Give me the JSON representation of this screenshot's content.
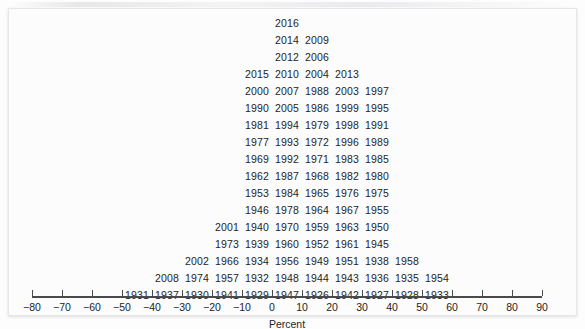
{
  "figure": {
    "background_color": "#fcfcfc",
    "text_color": "#242424",
    "axis_color": "#4a4a4a"
  },
  "axis": {
    "title": "Percent",
    "tick_labels": [
      "−80",
      "−70",
      "−60",
      "−50",
      "−40",
      "−30",
      "−20",
      "−10",
      "0",
      "10",
      "20",
      "30",
      "40",
      "50",
      "60",
      "70",
      "80",
      "90"
    ],
    "tick_values": [
      -80,
      -70,
      -60,
      -50,
      -40,
      -30,
      -20,
      -10,
      0,
      10,
      20,
      30,
      40,
      50,
      60,
      70,
      80,
      90
    ]
  },
  "chart_data": {
    "type": "bar",
    "subtype": "stacked-label-dotplot",
    "title": "",
    "subtitle": "",
    "xlabel": "Percent",
    "ylabel": "",
    "xlim": [
      -80,
      90
    ],
    "bin_width": 10,
    "grid": false,
    "legend": "none",
    "annotation": "Each label is one observation (a year) placed in its percent bin; labels stack upward within the bin.",
    "bins": [
      {
        "bin_center": -45,
        "bin_range": [
          -50,
          -40
        ],
        "count": 1,
        "labels": [
          "1931"
        ]
      },
      {
        "bin_center": -35,
        "bin_range": [
          -40,
          -30
        ],
        "count": 2,
        "labels": [
          "1937",
          "2008"
        ]
      },
      {
        "bin_center": -25,
        "bin_range": [
          -30,
          -20
        ],
        "count": 3,
        "labels": [
          "1930",
          "1974",
          "2002"
        ]
      },
      {
        "bin_center": -15,
        "bin_range": [
          -20,
          -10
        ],
        "count": 5,
        "labels": [
          "1941",
          "1957",
          "1966",
          "1973",
          "2001"
        ]
      },
      {
        "bin_center": -5,
        "bin_range": [
          -10,
          0
        ],
        "count": 14,
        "labels": [
          "1929",
          "1932",
          "1934",
          "1939",
          "1940",
          "1946",
          "1953",
          "1962",
          "1969",
          "1977",
          "1981",
          "1990",
          "2000",
          "2015"
        ]
      },
      {
        "bin_center": 5,
        "bin_range": [
          0,
          10
        ],
        "count": 18,
        "labels": [
          "1947",
          "1948",
          "1956",
          "1960",
          "1970",
          "1978",
          "1984",
          "1992",
          "1993",
          "1994",
          "2005",
          "2007",
          "2010",
          "2012",
          "2014",
          "2016"
        ]
      },
      {
        "bin_center": 15,
        "bin_range": [
          10,
          20
        ],
        "count": 16,
        "labels": [
          "1926",
          "1944",
          "1949",
          "1952",
          "1959",
          "1964",
          "1965",
          "1968",
          "1971",
          "1972",
          "1979",
          "1986",
          "1988",
          "2004",
          "2006",
          "2009"
        ]
      },
      {
        "bin_center": 25,
        "bin_range": [
          20,
          30
        ],
        "count": 14,
        "labels": [
          "1942",
          "1943",
          "1951",
          "1961",
          "1963",
          "1967",
          "1976",
          "1982",
          "1983",
          "1996",
          "1998",
          "1999",
          "2003"
        ]
      },
      {
        "bin_center": 35,
        "bin_range": [
          30,
          40
        ],
        "count": 12,
        "labels": [
          "1927",
          "1936",
          "1938",
          "1945",
          "1950",
          "1955",
          "1975",
          "1980",
          "1985",
          "1989",
          "1991",
          "1995",
          "1997",
          "2013"
        ]
      },
      {
        "bin_center": 45,
        "bin_range": [
          40,
          50
        ],
        "count": 3,
        "labels": [
          "1928",
          "1935",
          "1958"
        ]
      },
      {
        "bin_center": 55,
        "bin_range": [
          50,
          60
        ],
        "count": 2,
        "labels": [
          "1933",
          "1954"
        ]
      }
    ],
    "rows": [
      {
        "y": 17,
        "cells": [
          {
            "bin": 5,
            "label": "2016"
          }
        ]
      },
      {
        "y": 34,
        "cells": [
          {
            "bin": 5,
            "label": "2014"
          },
          {
            "bin": 15,
            "label": "2009"
          }
        ]
      },
      {
        "y": 51,
        "cells": [
          {
            "bin": 5,
            "label": "2012"
          },
          {
            "bin": 15,
            "label": "2006"
          }
        ]
      },
      {
        "y": 68,
        "cells": [
          {
            "bin": -5,
            "label": "2015"
          },
          {
            "bin": 5,
            "label": "2010"
          },
          {
            "bin": 15,
            "label": "2004"
          },
          {
            "bin": 25,
            "label": "2013"
          }
        ]
      },
      {
        "y": 85,
        "cells": [
          {
            "bin": -5,
            "label": "2000"
          },
          {
            "bin": 5,
            "label": "2007"
          },
          {
            "bin": 15,
            "label": "1988"
          },
          {
            "bin": 25,
            "label": "2003"
          },
          {
            "bin": 35,
            "label": "1997"
          }
        ]
      },
      {
        "y": 102,
        "cells": [
          {
            "bin": -5,
            "label": "1990"
          },
          {
            "bin": 5,
            "label": "2005"
          },
          {
            "bin": 15,
            "label": "1986"
          },
          {
            "bin": 25,
            "label": "1999"
          },
          {
            "bin": 35,
            "label": "1995"
          }
        ]
      },
      {
        "y": 119,
        "cells": [
          {
            "bin": -5,
            "label": "1981"
          },
          {
            "bin": 5,
            "label": "1994"
          },
          {
            "bin": 15,
            "label": "1979"
          },
          {
            "bin": 25,
            "label": "1998"
          },
          {
            "bin": 35,
            "label": "1991"
          }
        ]
      },
      {
        "y": 136,
        "cells": [
          {
            "bin": -5,
            "label": "1977"
          },
          {
            "bin": 5,
            "label": "1993"
          },
          {
            "bin": 15,
            "label": "1972"
          },
          {
            "bin": 25,
            "label": "1996"
          },
          {
            "bin": 35,
            "label": "1989"
          }
        ]
      },
      {
        "y": 153,
        "cells": [
          {
            "bin": -5,
            "label": "1969"
          },
          {
            "bin": 5,
            "label": "1992"
          },
          {
            "bin": 15,
            "label": "1971"
          },
          {
            "bin": 25,
            "label": "1983"
          },
          {
            "bin": 35,
            "label": "1985"
          }
        ]
      },
      {
        "y": 170,
        "cells": [
          {
            "bin": -5,
            "label": "1962"
          },
          {
            "bin": 5,
            "label": "1987"
          },
          {
            "bin": 15,
            "label": "1968"
          },
          {
            "bin": 25,
            "label": "1982"
          },
          {
            "bin": 35,
            "label": "1980"
          }
        ]
      },
      {
        "y": 187,
        "cells": [
          {
            "bin": -5,
            "label": "1953"
          },
          {
            "bin": 5,
            "label": "1984"
          },
          {
            "bin": 15,
            "label": "1965"
          },
          {
            "bin": 25,
            "label": "1976"
          },
          {
            "bin": 35,
            "label": "1975"
          }
        ]
      },
      {
        "y": 204,
        "cells": [
          {
            "bin": -5,
            "label": "1946"
          },
          {
            "bin": 5,
            "label": "1978"
          },
          {
            "bin": 15,
            "label": "1964"
          },
          {
            "bin": 25,
            "label": "1967"
          },
          {
            "bin": 35,
            "label": "1955"
          }
        ]
      },
      {
        "y": 221,
        "cells": [
          {
            "bin": -15,
            "label": "2001"
          },
          {
            "bin": -5,
            "label": "1940"
          },
          {
            "bin": 5,
            "label": "1970"
          },
          {
            "bin": 15,
            "label": "1959"
          },
          {
            "bin": 25,
            "label": "1963"
          },
          {
            "bin": 35,
            "label": "1950"
          }
        ]
      },
      {
        "y": 238,
        "cells": [
          {
            "bin": -15,
            "label": "1973"
          },
          {
            "bin": -5,
            "label": "1939"
          },
          {
            "bin": 5,
            "label": "1960"
          },
          {
            "bin": 15,
            "label": "1952"
          },
          {
            "bin": 25,
            "label": "1961"
          },
          {
            "bin": 35,
            "label": "1945"
          }
        ]
      },
      {
        "y": 255,
        "cells": [
          {
            "bin": -25,
            "label": "2002"
          },
          {
            "bin": -15,
            "label": "1966"
          },
          {
            "bin": -5,
            "label": "1934"
          },
          {
            "bin": 5,
            "label": "1956"
          },
          {
            "bin": 15,
            "label": "1949"
          },
          {
            "bin": 25,
            "label": "1951"
          },
          {
            "bin": 35,
            "label": "1938"
          },
          {
            "bin": 45,
            "label": "1958"
          }
        ]
      },
      {
        "y": 272,
        "cells": [
          {
            "bin": -35,
            "label": "2008"
          },
          {
            "bin": -25,
            "label": "1974"
          },
          {
            "bin": -15,
            "label": "1957"
          },
          {
            "bin": -5,
            "label": "1932"
          },
          {
            "bin": 5,
            "label": "1948"
          },
          {
            "bin": 15,
            "label": "1944"
          },
          {
            "bin": 25,
            "label": "1943"
          },
          {
            "bin": 35,
            "label": "1936"
          },
          {
            "bin": 45,
            "label": "1935"
          },
          {
            "bin": 55,
            "label": "1954"
          }
        ]
      },
      {
        "y": 289,
        "cells": [
          {
            "bin": -45,
            "label": "1931"
          },
          {
            "bin": -35,
            "label": "1937"
          },
          {
            "bin": -25,
            "label": "1930"
          },
          {
            "bin": -15,
            "label": "1941"
          },
          {
            "bin": -5,
            "label": "1929"
          },
          {
            "bin": 5,
            "label": "1947"
          },
          {
            "bin": 15,
            "label": "1926"
          },
          {
            "bin": 25,
            "label": "1942"
          },
          {
            "bin": 35,
            "label": "1927"
          },
          {
            "bin": 45,
            "label": "1928"
          },
          {
            "bin": 55,
            "label": "1933"
          }
        ]
      }
    ]
  }
}
